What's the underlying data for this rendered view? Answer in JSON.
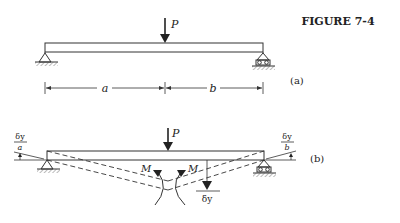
{
  "figure": {
    "title": "FIGURE 7-4",
    "part_a": {
      "label": "(a)",
      "load_label": "P",
      "dim_left_label": "a",
      "dim_right_label": "b"
    },
    "part_b": {
      "label": "(b)",
      "load_label": "P",
      "moment_left_label": "M",
      "moment_right_label": "M",
      "deflection_label": "δy",
      "left_slope_num": "δy",
      "left_slope_den": "a",
      "right_slope_num": "δy",
      "right_slope_den": "b"
    }
  }
}
